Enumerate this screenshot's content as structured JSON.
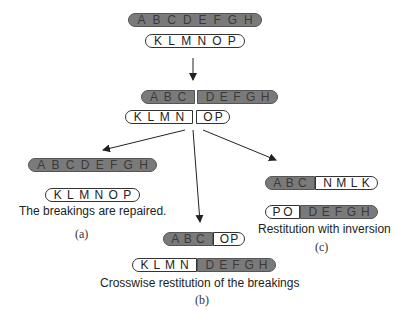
{
  "initial": {
    "chromosome1": [
      "A",
      "B",
      "C",
      "D",
      "E",
      "F",
      "G",
      "H"
    ],
    "chromosome2": [
      "K",
      "L",
      "M",
      "N",
      "O",
      "P"
    ]
  },
  "broken": {
    "chromosome1": {
      "left": [
        "A",
        "B",
        "C"
      ],
      "right": [
        "D",
        "E",
        "F",
        "G",
        "H"
      ]
    },
    "chromosome2": {
      "left": [
        "K",
        "L",
        "M",
        "N"
      ],
      "right": [
        "O",
        "P"
      ]
    }
  },
  "outcome_a": {
    "chromosome1": [
      "A",
      "B",
      "C",
      "D",
      "E",
      "F",
      "G",
      "H"
    ],
    "chromosome2": [
      "K",
      "L",
      "M",
      "N",
      "O",
      "P"
    ],
    "caption": "The breakings are repaired.",
    "label": "(a)"
  },
  "outcome_b": {
    "chromosome1": {
      "left": [
        "A",
        "B",
        "C"
      ],
      "right": [
        "O",
        "P"
      ]
    },
    "chromosome2": {
      "left": [
        "K",
        "L",
        "M",
        "N"
      ],
      "right": [
        "D",
        "E",
        "F",
        "G",
        "H"
      ]
    },
    "caption": "Crosswise restitution of the breakings",
    "label": "(b)"
  },
  "outcome_c": {
    "chromosome1": {
      "left": [
        "A",
        "B",
        "C"
      ],
      "right": [
        "N",
        "M",
        "L",
        "K"
      ]
    },
    "chromosome2": {
      "left": [
        "P",
        "O"
      ],
      "right": [
        "D",
        "E",
        "F",
        "G",
        "H"
      ]
    },
    "caption": "Restitution with inversion",
    "label": "(c)"
  },
  "colors": {
    "gray_segment": "#7a7a7a",
    "white_segment": "#ffffff",
    "outline": "#333333"
  }
}
